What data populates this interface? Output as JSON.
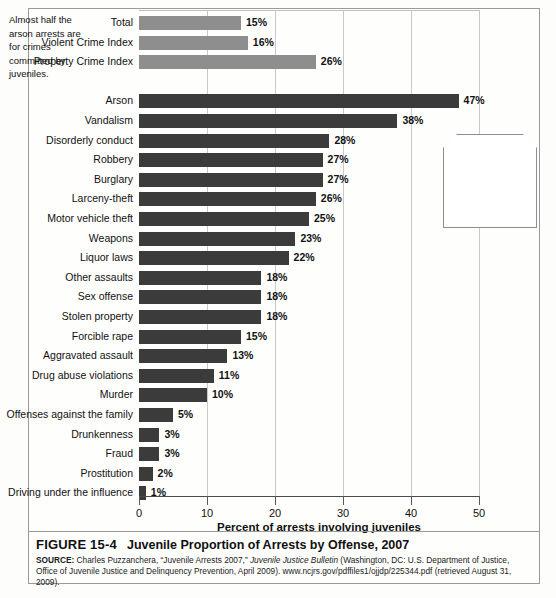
{
  "figure": {
    "number": "FIGURE 15-4",
    "title": "Juvenile Proportion of Arrests by Offense, 2007",
    "source_prefix": "SOURCE:",
    "source_part1": " Charles Puzzanchera, “Juvenile Arrests 2007,” ",
    "source_italic": "Juvenile Justice Bulletin",
    "source_part2": " (Washington, DC: U.S. Department of Justice, Office of Juvenile Justice and Delinquency Prevention, April 2009). www.ncjrs.gov/pdffiles1/ojjdp/225344.pdf (retrieved August 31, 2009)."
  },
  "callout": {
    "text": "Almost half the arson arrests are for crimes committed by juveniles."
  },
  "colors": {
    "summary_bar": "#8e8e8e",
    "offense_bar": "#3b3b3b",
    "gridline": "#c9c9c9",
    "frame": "#9a9a9a"
  },
  "chart_data": {
    "type": "bar",
    "orientation": "horizontal",
    "title": "Juvenile Proportion of Arrests by Offense, 2007",
    "xlabel": "Percent of arrests involving juveniles",
    "ylabel": "",
    "xlim": [
      0,
      50
    ],
    "xticks": [
      0,
      10,
      20,
      30,
      40,
      50
    ],
    "xticklabels": [
      "0",
      "10",
      "20",
      "30",
      "40",
      "50"
    ],
    "grid": true,
    "legend": "none",
    "value_suffix": "%",
    "groups": [
      {
        "name": "summary",
        "color": "#8e8e8e",
        "categories": [
          "Total",
          "Violent Crime Index",
          "Property Crime Index"
        ],
        "values": [
          15,
          16,
          26
        ],
        "labels": [
          "15%",
          "16%",
          "26%"
        ]
      },
      {
        "name": "offenses",
        "color": "#3b3b3b",
        "categories": [
          "Arson",
          "Vandalism",
          "Disorderly conduct",
          "Robbery",
          "Burglary",
          "Larceny-theft",
          "Motor vehicle theft",
          "Weapons",
          "Liquor laws",
          "Other assaults",
          "Sex offense",
          "Stolen property",
          "Forcible rape",
          "Aggravated assault",
          "Drug abuse violations",
          "Murder",
          "Offenses against the family",
          "Drunkenness",
          "Fraud",
          "Prostitution",
          "Driving under the influence"
        ],
        "values": [
          47,
          38,
          28,
          27,
          27,
          26,
          25,
          23,
          22,
          18,
          18,
          18,
          15,
          13,
          11,
          10,
          5,
          3,
          3,
          2,
          1
        ],
        "labels": [
          "47%",
          "38%",
          "28%",
          "27%",
          "27%",
          "26%",
          "25%",
          "23%",
          "22%",
          "18%",
          "18%",
          "18%",
          "15%",
          "13%",
          "11%",
          "10%",
          "5%",
          "3%",
          "3%",
          "2%",
          "1%"
        ]
      }
    ]
  }
}
